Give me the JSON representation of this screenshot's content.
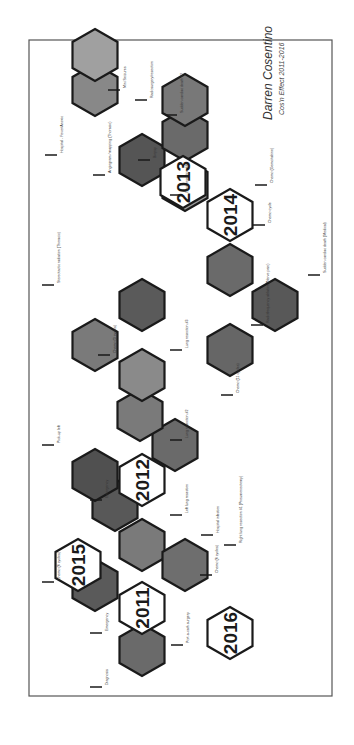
{
  "poster": {
    "author": "Darren Cosentino",
    "subtitle": "Cos'n Effect 2011-2016",
    "border_color": "#555555",
    "hex_stroke": "#1a1a1a",
    "rotation_deg": -90
  },
  "years": [
    {
      "label": "2011",
      "cx": 137,
      "cy": 142
    },
    {
      "label": "2012",
      "cx": 265,
      "cy": 142
    },
    {
      "label": "2013",
      "cx": 563,
      "cy": 183
    },
    {
      "label": "2014",
      "cx": 530,
      "cy": 230
    },
    {
      "label": "2015",
      "cx": 180,
      "cy": 78
    },
    {
      "label": "2016",
      "cx": 112,
      "cy": 230
    }
  ],
  "photos": [
    {
      "name": "diagnosis",
      "cx": 95,
      "cy": 142,
      "shade": "#6a6a6a"
    },
    {
      "name": "chemo-2-rounds",
      "cx": 160,
      "cy": 95,
      "shade": "#5a5a5a"
    },
    {
      "name": "left-collarbone-port",
      "cx": 200,
      "cy": 142,
      "shade": "#7a7a7a"
    },
    {
      "name": "hospital-infection",
      "cx": 180,
      "cy": 185,
      "shade": "#6e6e6e"
    },
    {
      "name": "emergency-surgery",
      "cx": 240,
      "cy": 115,
      "shade": "#585858"
    },
    {
      "name": "pick-up-left",
      "cx": 270,
      "cy": 95,
      "shade": "#505050"
    },
    {
      "name": "chemo-11-cycles",
      "cx": 300,
      "cy": 175,
      "shade": "#6a6a6a"
    },
    {
      "name": "chemo-3-cycles",
      "cx": 330,
      "cy": 140,
      "shade": "#7a7a7a"
    },
    {
      "name": "lung-resection-2",
      "cx": 370,
      "cy": 142,
      "shade": "#8a8a8a"
    },
    {
      "name": "stereotactic-radiation",
      "cx": 400,
      "cy": 95,
      "shade": "#7a7a7a"
    },
    {
      "name": "lung-resection-3",
      "cx": 440,
      "cy": 142,
      "shade": "#5a5a5a"
    },
    {
      "name": "radiofrequency-ablation",
      "cx": 395,
      "cy": 230,
      "shade": "#666666"
    },
    {
      "name": "sudden-cardiac-death-2",
      "cx": 440,
      "cy": 275,
      "shade": "#585858"
    },
    {
      "name": "chemo-cycle",
      "cx": 475,
      "cy": 230,
      "shade": "#6a6a6a"
    },
    {
      "name": "kidney-mapping",
      "cx": 585,
      "cy": 142,
      "shade": "#555555"
    },
    {
      "name": "biopsy",
      "cx": 560,
      "cy": 185,
      "shade": "#9a9a9a"
    },
    {
      "name": "chemo-follow-up",
      "cx": 610,
      "cy": 185,
      "shade": "#6a6a6a"
    },
    {
      "name": "hospital-stay",
      "cx": 655,
      "cy": 95,
      "shade": "#888888"
    },
    {
      "name": "back-surgery",
      "cx": 645,
      "cy": 185,
      "shade": "#787878"
    },
    {
      "name": "family",
      "cx": 690,
      "cy": 95,
      "shade": "#a0a0a0"
    }
  ],
  "labels": [
    {
      "text": "Diagnosis",
      "x": 58,
      "y": 100,
      "anchor": "start"
    },
    {
      "text": "Port-a-cath surgery",
      "x": 100,
      "y": 181,
      "anchor": "start"
    },
    {
      "text": "Emergency",
      "x": 112,
      "y": 100,
      "anchor": "start"
    },
    {
      "text": "Chemo (6 cycles)",
      "x": 163,
      "y": 52,
      "anchor": "start"
    },
    {
      "text": "Chemo (6 cycles)",
      "x": 170,
      "y": 210,
      "anchor": "start"
    },
    {
      "text": "Right lung resection #1 (Pneumonectomy)",
      "x": 200,
      "y": 234,
      "anchor": "start"
    },
    {
      "text": "Hospital infection",
      "x": 210,
      "y": 211,
      "anchor": "start"
    },
    {
      "text": "Left lung resection",
      "x": 230,
      "y": 180,
      "anchor": "start"
    },
    {
      "text": "Emergency",
      "x": 245,
      "y": 100,
      "anchor": "start"
    },
    {
      "text": "Pick-up left",
      "x": 300,
      "y": 52,
      "anchor": "start"
    },
    {
      "text": "Lung resection #2",
      "x": 305,
      "y": 180,
      "anchor": "start"
    },
    {
      "text": "Chemo (11 cycles)",
      "x": 350,
      "y": 231,
      "anchor": "start"
    },
    {
      "text": "Chemo (3 cycles)",
      "x": 390,
      "y": 108,
      "anchor": "start"
    },
    {
      "text": "Lung resection #3",
      "x": 395,
      "y": 180,
      "anchor": "start"
    },
    {
      "text": "Radiofrequency ablation (Nerve pain)",
      "x": 420,
      "y": 261,
      "anchor": "start"
    },
    {
      "text": "Stereotactic radiation (Thoracic)",
      "x": 460,
      "y": 52,
      "anchor": "start"
    },
    {
      "text": "Sudden cardiac death (Medical)",
      "x": 470,
      "y": 318,
      "anchor": "start"
    },
    {
      "text": "Chemo cycle",
      "x": 520,
      "y": 263,
      "anchor": "start"
    },
    {
      "text": "Lung resection #4",
      "x": 550,
      "y": 180,
      "anchor": "start"
    },
    {
      "text": "Biopsy",
      "x": 585,
      "y": 148,
      "anchor": "start"
    },
    {
      "text": "Chemo (Gemcitabine)",
      "x": 560,
      "y": 265,
      "anchor": "start"
    },
    {
      "text": "Angiogram / mapping (Thoracic)",
      "x": 570,
      "y": 103,
      "anchor": "start"
    },
    {
      "text": "Sudden cardiac death #2",
      "x": 630,
      "y": 175,
      "anchor": "start"
    },
    {
      "text": "Hospital - Fever/Anoxic",
      "x": 590,
      "y": 55,
      "anchor": "start"
    },
    {
      "text": "Radiosurgery/resection",
      "x": 645,
      "y": 145,
      "anchor": "start"
    },
    {
      "text": "Mini Seizures",
      "x": 655,
      "y": 118,
      "anchor": "start"
    }
  ]
}
